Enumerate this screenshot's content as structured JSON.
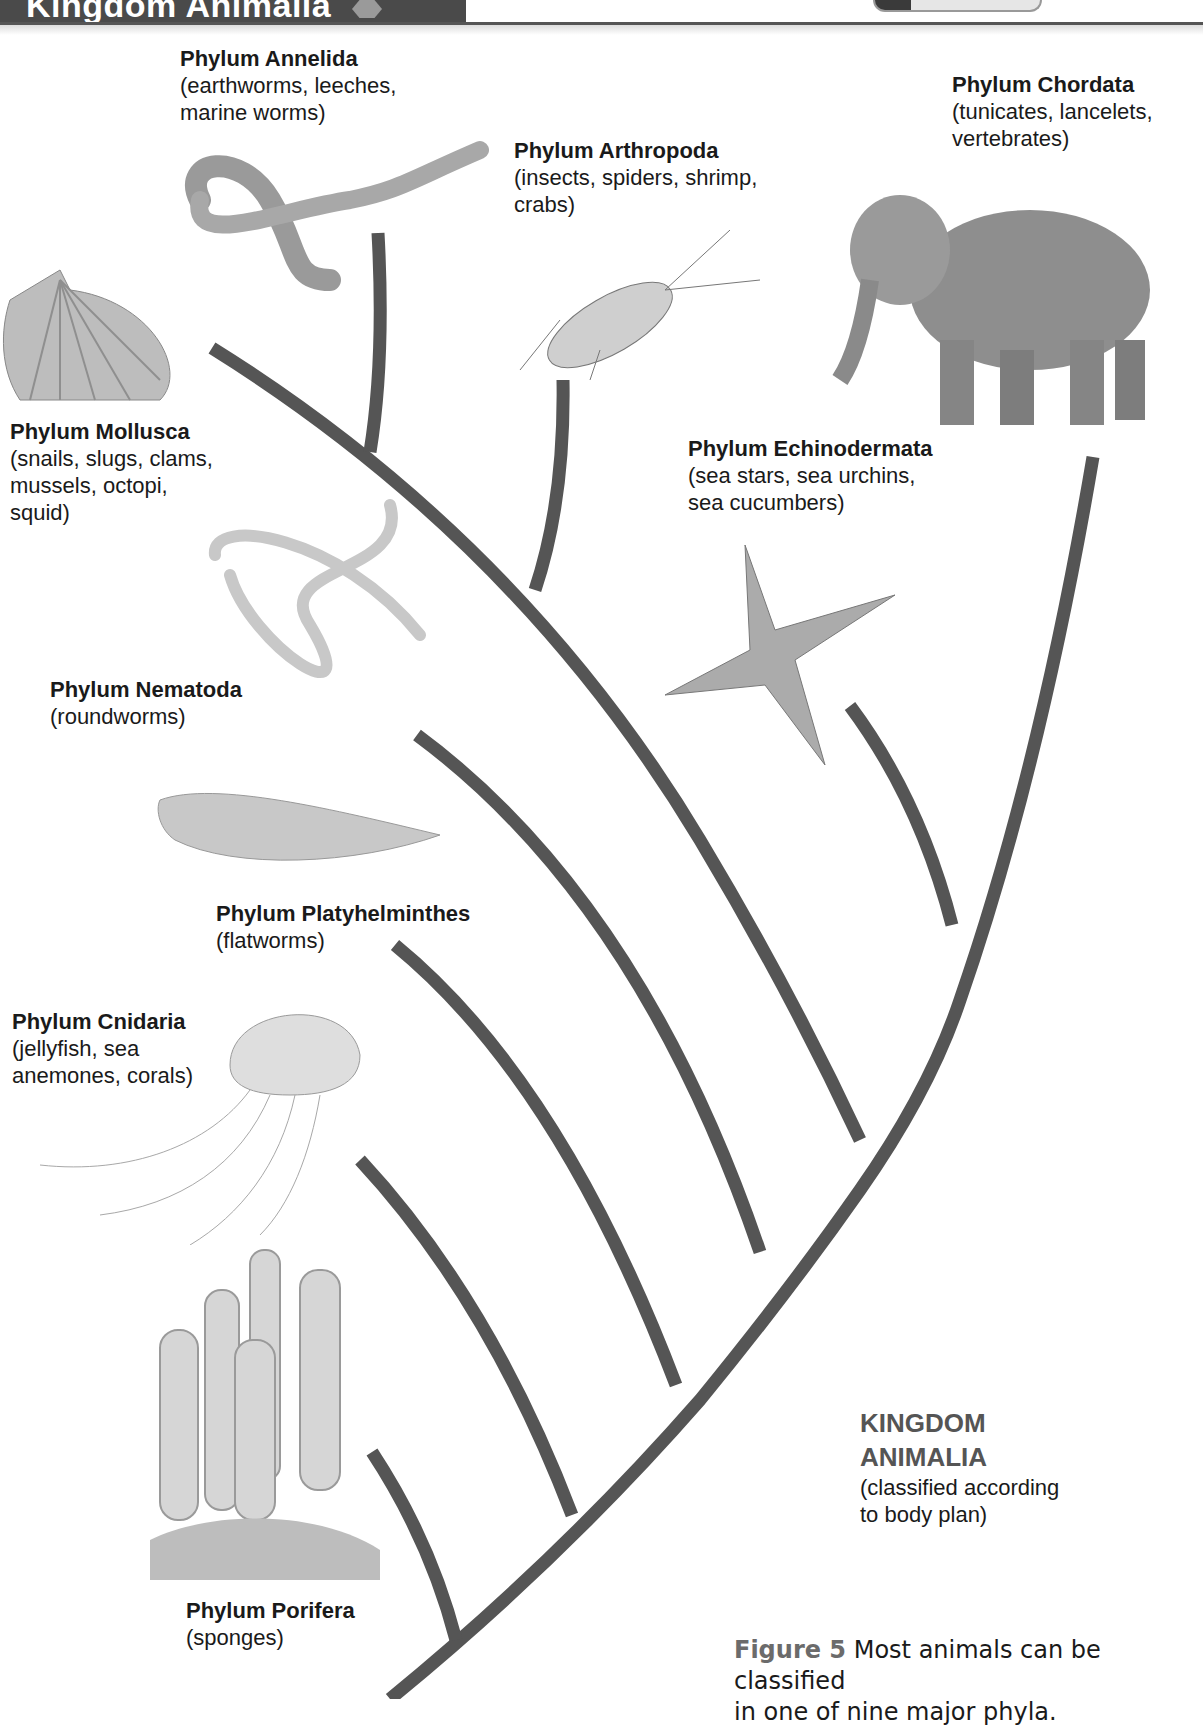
{
  "header": {
    "title": "Kingdom Animalia"
  },
  "phyla": [
    {
      "id": "annelida",
      "title": "Phylum Annelida",
      "desc": "(earthworms, leeches,\nmarine worms)",
      "illustration": "earthworm-icon"
    },
    {
      "id": "arthropoda",
      "title": "Phylum Arthropoda",
      "desc": "(insects, spiders, shrimp,\ncrabs)",
      "illustration": "cockroach-icon"
    },
    {
      "id": "chordata",
      "title": "Phylum Chordata",
      "desc": "(tunicates, lancelets,\nvertebrates)",
      "illustration": "elephant-icon"
    },
    {
      "id": "mollusca",
      "title": "Phylum Mollusca",
      "desc": "(snails, slugs, clams,\nmussels, octopi,\nsquid)",
      "illustration": "scallop-shell-icon"
    },
    {
      "id": "echinodermata",
      "title": "Phylum Echinodermata",
      "desc": "(sea stars, sea urchins,\nsea cucumbers)",
      "illustration": "sea-star-icon"
    },
    {
      "id": "nematoda",
      "title": "Phylum Nematoda",
      "desc": "(roundworms)",
      "illustration": "roundworm-icon"
    },
    {
      "id": "platyhelminthes",
      "title": "Phylum Platyhelminthes",
      "desc": "(flatworms)",
      "illustration": "flatworm-icon"
    },
    {
      "id": "cnidaria",
      "title": "Phylum Cnidaria",
      "desc": "(jellyfish, sea\nanemones, corals)",
      "illustration": "jellyfish-icon"
    },
    {
      "id": "porifera",
      "title": "Phylum Porifera",
      "desc": "(sponges)",
      "illustration": "sponge-icon"
    }
  ],
  "kingdom_label": {
    "title": "KINGDOM\nANIMALIA",
    "desc": "(classified according\nto body plan)"
  },
  "caption": {
    "figure": "Figure 5",
    "text": "  Most animals can be classified\nin one of nine major phyla."
  },
  "colors": {
    "branch": "#555555",
    "header_bg": "#4a4a4a",
    "figure_label": "#6b6b6b"
  }
}
